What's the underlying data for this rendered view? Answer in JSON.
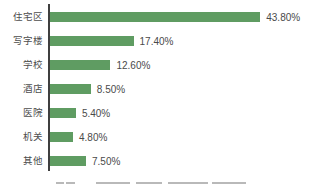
{
  "chart_data": {
    "type": "bar",
    "orientation": "horizontal",
    "title": "",
    "xlabel": "",
    "ylabel": "",
    "categories": [
      "住宅区",
      "写字楼",
      "学校",
      "酒店",
      "医院",
      "机关",
      "其他"
    ],
    "values": [
      43.8,
      17.4,
      12.6,
      8.5,
      5.4,
      4.8,
      7.5
    ],
    "value_labels": [
      "43.80%",
      "17.40%",
      "12.60%",
      "8.50%",
      "5.40%",
      "4.80%",
      "7.50%"
    ],
    "xlim": [
      0,
      45
    ],
    "grid": false,
    "legend": false,
    "px_per_percent": 4.8,
    "bar_color": "#5f9c62",
    "axis_color": "#3f3f3f",
    "label_color": "#4d4d4d",
    "value_color": "#4a4a4a"
  }
}
